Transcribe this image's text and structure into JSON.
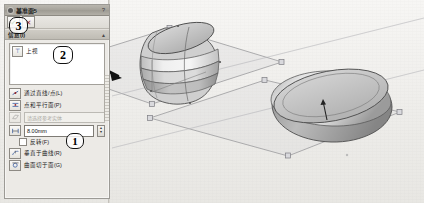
{
  "app": {
    "type": "cad-property-manager",
    "colors": {
      "accent": "#3b5fa4",
      "ok_green": "#1f7a2e",
      "cancel_red": "#9b2020",
      "panel_bg": "#eceae6",
      "viewport_bg": "#f2f1ef",
      "callout_stroke": "#111111",
      "model_shade_light": "#e6e6e6",
      "model_shade_mid": "#cfcfcf",
      "model_shade_dark": "#a8a8a8"
    }
  },
  "panel": {
    "title": "基准面5",
    "help_label": "?",
    "pin_icon": "pin-icon",
    "confirm": {
      "ok_label": "✔",
      "cancel_label": "✕"
    },
    "sections": [
      {
        "header": "信息(I)",
        "collapse_glyph": "▲"
      }
    ],
    "selection": {
      "icon": "plane-reference-icon",
      "value": "上视"
    },
    "options": [
      {
        "icon": "line-point-icon",
        "label": "通过直线/点(L)",
        "disabled": false
      },
      {
        "icon": "point-parallel-icon",
        "label": "点和平行面(P)",
        "disabled": false
      },
      {
        "icon": "parallel-plane-icon",
        "label": "",
        "placeholder": "请选择参考实体",
        "disabled": true,
        "type": "ghost-input"
      }
    ],
    "distance": {
      "icon": "offset-distance-icon",
      "value": "8.00mm",
      "spinner_up": "▲",
      "spinner_down": "▼"
    },
    "flip": {
      "label": "反转(F)",
      "checked": false
    },
    "bottom_options": [
      {
        "icon": "perpendicular-curve-icon",
        "label": "垂直于曲线(R)"
      },
      {
        "icon": "surface-tangent-icon",
        "label": "曲面切于面(G)"
      }
    ]
  },
  "callouts": [
    {
      "id": "callout-3",
      "number": "3"
    },
    {
      "id": "callout-2",
      "number": "2"
    },
    {
      "id": "callout-1",
      "number": "1"
    }
  ],
  "viewport": {
    "bodies": [
      {
        "name": "barrel-body",
        "description": "revolved barrel solid with banded profile"
      },
      {
        "name": "puck-body",
        "description": "revolved flattened disc solid"
      }
    ],
    "planes": [
      {
        "name": "reference-plane-upper"
      },
      {
        "name": "reference-plane-lower"
      }
    ]
  }
}
